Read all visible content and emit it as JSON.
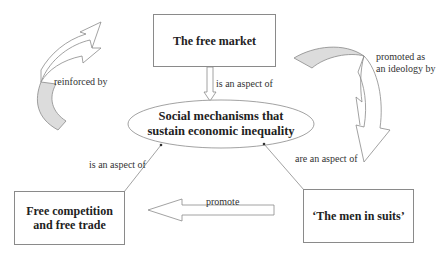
{
  "diagram": {
    "nodes": {
      "free_market": "The free market",
      "social_mechanisms_line1": "Social mechanisms that",
      "social_mechanisms_line2": "sustain economic inequality",
      "free_competition_line1": "Free competition",
      "free_competition_line2": "and free trade",
      "men_in_suits": "‘The men in suits’"
    },
    "edges": {
      "reinforced_by": "reinforced by",
      "promoted_line1": "promoted as",
      "promoted_line2": "an ideology by",
      "market_aspect": "is an aspect of",
      "competition_aspect": "is an aspect of",
      "suits_aspect": "are an aspect of",
      "promote": "promote"
    },
    "colors": {
      "stroke": "#8a8a8a",
      "arrow_shade": "#dcdcdc"
    }
  }
}
